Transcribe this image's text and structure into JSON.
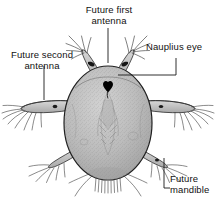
{
  "figure": {
    "background_color": "#ffffff",
    "ink_color": "#1a1a1a",
    "body_fill_color": "#b8b8b8",
    "eye_color": "#000000",
    "width": 218,
    "height": 206
  },
  "labels": {
    "first_antenna": "Future first\nantenna",
    "second_antenna": "Future second\nantenna",
    "nauplius_eye": "Nauplius eye",
    "mandible": "Future\nmandible"
  },
  "parts": {
    "body": "body-oval",
    "eye": "nauplius-eye-spot",
    "first_antenna_left": "first-antenna-left",
    "first_antenna_right": "first-antenna-right",
    "second_antenna_left": "second-antenna-left",
    "second_antenna_right": "second-antenna-right",
    "mandible_left": "mandible-left",
    "mandible_right": "mandible-right",
    "posterior_setae": "posterior-seta-fringe"
  },
  "leaders": {
    "first_antenna": "vertical-leader-line",
    "second_antenna": "vertical-leader-line",
    "nauplius_eye": "elbow-leader-line",
    "mandible": "elbow-leader-line"
  }
}
